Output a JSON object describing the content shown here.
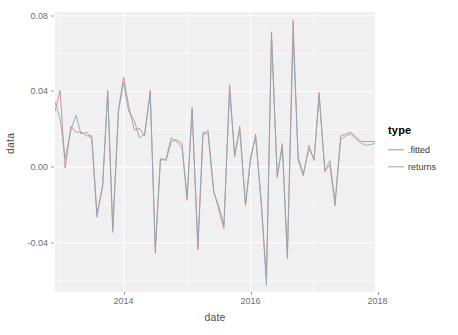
{
  "chart_data": {
    "type": "line",
    "title": "",
    "xlabel": "date",
    "ylabel": "data",
    "xlim": [
      2012.92,
      2017.96
    ],
    "ylim": [
      -0.066,
      0.082
    ],
    "grid": true,
    "legend": {
      "position": "right",
      "title": "type",
      "entries": [
        {
          "name": ".fitted",
          "color": "#c9878a"
        },
        {
          "name": "returns",
          "color": "#8fa8b4"
        }
      ]
    },
    "x_ticks": [
      {
        "value": 2014,
        "label": "2014"
      },
      {
        "value": 2016,
        "label": "2016"
      },
      {
        "value": 2018,
        "label": "2018"
      }
    ],
    "y_ticks": [
      {
        "value": 0.08,
        "label": "0.08"
      },
      {
        "value": 0.04,
        "label": "0.04"
      },
      {
        "value": 0.0,
        "label": "0.00"
      },
      {
        "value": -0.04,
        "label": "-0.04"
      }
    ],
    "x": [
      2012.92,
      2013.0,
      2013.08,
      2013.17,
      2013.25,
      2013.33,
      2013.42,
      2013.5,
      2013.58,
      2013.67,
      2013.75,
      2013.83,
      2013.92,
      2014.0,
      2014.08,
      2014.17,
      2014.25,
      2014.33,
      2014.42,
      2014.5,
      2014.58,
      2014.67,
      2014.75,
      2014.83,
      2014.92,
      2015.0,
      2015.08,
      2015.17,
      2015.25,
      2015.33,
      2015.42,
      2015.5,
      2015.58,
      2015.67,
      2015.75,
      2015.83,
      2015.92,
      2016.0,
      2016.08,
      2016.17,
      2016.25,
      2016.33,
      2016.42,
      2016.5,
      2016.58,
      2016.67,
      2016.75,
      2016.83,
      2016.92,
      2017.0,
      2017.08,
      2017.17,
      2017.25,
      2017.33,
      2017.42,
      2017.5,
      2017.58,
      2017.67,
      2017.75,
      2017.83,
      2017.96
    ],
    "series": [
      {
        "name": ".fitted",
        "color": "#c9878a",
        "values": [
          0.0295,
          0.0405,
          -0.0005,
          0.0215,
          0.0185,
          0.0185,
          0.0165,
          0.0165,
          -0.0245,
          -0.0105,
          0.0405,
          -0.0325,
          0.0305,
          0.0475,
          0.0325,
          0.0195,
          0.0205,
          0.0165,
          0.0405,
          -0.0455,
          0.0045,
          0.0035,
          0.0135,
          0.0145,
          0.0125,
          -0.0175,
          0.0315,
          -0.0435,
          0.0165,
          0.0195,
          -0.0125,
          -0.0225,
          -0.0325,
          0.0435,
          0.0055,
          0.0215,
          -0.0205,
          0.0035,
          0.0175,
          -0.0205,
          -0.0585,
          0.0715,
          -0.0055,
          0.0125,
          -0.0465,
          0.0775,
          0.0035,
          -0.0045,
          0.0115,
          0.0035,
          0.0395,
          -0.0025,
          0.0015,
          -0.0205,
          0.0165,
          0.0175,
          0.0185,
          0.0155,
          0.0135,
          0.0135,
          0.0135
        ]
      },
      {
        "name": "returns",
        "color": "#8fa8b4",
        "values": [
          0.0345,
          0.0255,
          0.0045,
          0.0195,
          0.0275,
          0.0175,
          0.0185,
          0.0145,
          -0.0265,
          -0.0095,
          0.0395,
          -0.0345,
          0.0295,
          0.0445,
          0.0295,
          0.0245,
          0.0155,
          0.0175,
          0.0385,
          -0.0425,
          0.0035,
          0.0045,
          0.0155,
          0.0135,
          0.0105,
          -0.0155,
          0.0295,
          -0.0415,
          0.0185,
          0.0175,
          -0.0135,
          -0.0205,
          -0.0305,
          0.0405,
          0.0065,
          0.0195,
          -0.0195,
          0.0055,
          0.0155,
          -0.0185,
          -0.0625,
          0.0685,
          -0.0045,
          0.0105,
          -0.0485,
          0.0685,
          0.0055,
          -0.0035,
          0.0095,
          0.0045,
          0.0375,
          -0.0015,
          0.0035,
          -0.0185,
          0.0145,
          0.0165,
          0.0175,
          0.0145,
          0.0125,
          0.0115,
          0.0125
        ]
      }
    ],
    "panel": {
      "background": "#f0f0f0",
      "gridline_color": "#ffffff"
    }
  }
}
